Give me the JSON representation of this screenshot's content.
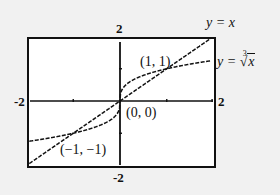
{
  "chart_data": {
    "type": "line",
    "title": "",
    "xlabel": "",
    "ylabel": "",
    "xlim": [
      -2,
      2
    ],
    "ylim": [
      -2,
      2
    ],
    "grid": false,
    "legend": "inline labels at right",
    "tick_labels": {
      "x_min": "-2",
      "x_max": "2",
      "y_max": "2",
      "y_min": "-2"
    },
    "series": [
      {
        "name": "y = x",
        "label_prefix": "y = ",
        "label_var": "x",
        "function": "x",
        "style": "dashed",
        "x": [
          -2,
          -1,
          0,
          1,
          2
        ],
        "y": [
          -2,
          -1,
          0,
          1,
          2
        ]
      },
      {
        "name": "y = ∛x",
        "label_prefix": "y = ",
        "label_index": "3",
        "label_radical": "√",
        "label_var": "x",
        "function": "cbrt(x)",
        "style": "dashed",
        "x": [
          -2,
          -1,
          -0.125,
          0,
          0.125,
          1,
          2
        ],
        "y": [
          -1.26,
          -1,
          -0.5,
          0,
          0.5,
          1,
          1.26
        ]
      }
    ],
    "annotations": [
      {
        "text": "(1, 1)",
        "x": 1,
        "y": 1
      },
      {
        "text": "(0, 0)",
        "x": 0,
        "y": 0
      },
      {
        "text": "(−1, −1)",
        "x": -1,
        "y": -1
      }
    ]
  },
  "colors": {
    "background": "#f1f1f1",
    "plot_bg": "#ffffff",
    "ink": "#111111"
  }
}
